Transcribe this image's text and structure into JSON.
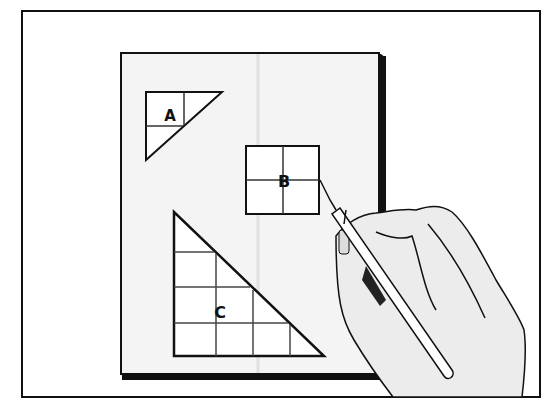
{
  "illustration": {
    "description": "Hand using a craft knife to cut shapes A, B, C from a sheet with grid lines",
    "shapes": [
      {
        "id": "A",
        "label": "A",
        "type": "right-triangle",
        "grid": "2x2"
      },
      {
        "id": "B",
        "label": "B",
        "type": "square",
        "grid": "2x2"
      },
      {
        "id": "C",
        "label": "C",
        "type": "right-triangle",
        "grid": "4x4"
      }
    ],
    "colors": {
      "line": "#111111",
      "paper": "#f4f4f4",
      "background": "#ffffff",
      "skin": "#ececec"
    }
  }
}
